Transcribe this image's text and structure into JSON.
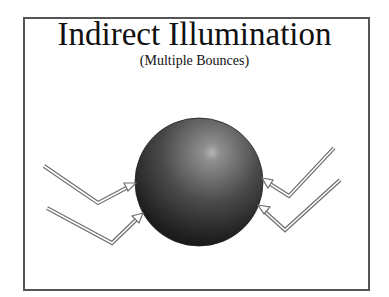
{
  "slide": {
    "title": "Indirect Illumination",
    "subtitle": "(Multiple Bounces)"
  },
  "diagram": {
    "sphere": {
      "cx": 199,
      "cy": 182,
      "r": 64,
      "color_dark": "#1a1a1a",
      "color_light": "#9a9a9a"
    },
    "arrows": [
      {
        "side": "left",
        "points": "44,166 98,203 134,184"
      },
      {
        "side": "left",
        "points": "47,208 112,243 142,214"
      },
      {
        "side": "right",
        "points": "334,148 289,196 263,179"
      },
      {
        "side": "right",
        "points": "340,180 285,230 259,206"
      }
    ],
    "arrow_color": "#777777"
  }
}
